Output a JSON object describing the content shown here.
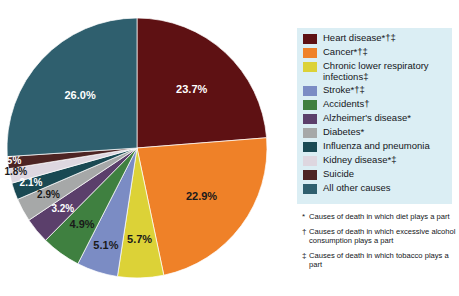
{
  "chart_data": {
    "type": "pie",
    "title": "",
    "subtitle": "",
    "xlabel": "",
    "ylabel": "",
    "legend_position": "right",
    "grid": false,
    "start_angle_deg": 0,
    "direction": "clockwise",
    "categories": [
      "Heart disease*†‡",
      "Cancer*†‡",
      "Chronic lower respiratory infections‡",
      "Stroke*†‡",
      "Accidents†",
      "Alzheimer's disease*",
      "Diabetes*",
      "Influenza and pneumonia",
      "Kidney disease*‡",
      "Suicide",
      "All other causes"
    ],
    "values": [
      23.7,
      22.9,
      5.7,
      5.1,
      4.9,
      3.2,
      2.9,
      2.1,
      1.8,
      1.5,
      26.0
    ],
    "value_labels": [
      "23.7%",
      "22.9%",
      "5.7%",
      "5.1%",
      "4.9%",
      "3.2%",
      "2.9%",
      "2.1%",
      "1.8%",
      "1.5%",
      "26.0%"
    ],
    "colors": [
      "#5e1113",
      "#ef8128",
      "#dcd237",
      "#7b8cc4",
      "#3f8040",
      "#5b3f6b",
      "#a6a8a8",
      "#1a4953",
      "#ded7e0",
      "#4d2423",
      "#2f5f6e"
    ],
    "label_text_color": [
      "#ffffff",
      "#1a1a1a",
      "#1a1a1a",
      "#1a1a1a",
      "#1a1a1a",
      "#ffffff",
      "#1a1a1a",
      "#ffffff",
      "#1a1a1a",
      "#ffffff",
      "#ffffff"
    ],
    "units": "percent",
    "total": 99.8
  },
  "legend": {
    "background_color": "#dbeef4",
    "items": [
      {
        "label": "Heart disease*†‡",
        "color": "#5e1113"
      },
      {
        "label": "Cancer*†‡",
        "color": "#ef8128"
      },
      {
        "label": "Chronic lower respiratory\ninfections‡",
        "color": "#dcd237"
      },
      {
        "label": "Stroke*†‡",
        "color": "#7b8cc4"
      },
      {
        "label": "Accidents†",
        "color": "#3f8040"
      },
      {
        "label": "Alzheimer's disease*",
        "color": "#5b3f6b"
      },
      {
        "label": "Diabetes*",
        "color": "#a6a8a8"
      },
      {
        "label": "Influenza and pneumonia",
        "color": "#1a4953"
      },
      {
        "label": "Kidney disease*‡",
        "color": "#ded7e0"
      },
      {
        "label": "Suicide",
        "color": "#4d2423"
      },
      {
        "label": "All other causes",
        "color": "#2f5f6e"
      }
    ]
  },
  "footnotes": [
    {
      "mark": "*",
      "text": "Causes of death in which diet plays a part"
    },
    {
      "mark": "†",
      "text": "Causes of death in which excessive alcohol consumption plays a part"
    },
    {
      "mark": "‡",
      "text": "Causes of death in which tobacco plays a part"
    }
  ]
}
